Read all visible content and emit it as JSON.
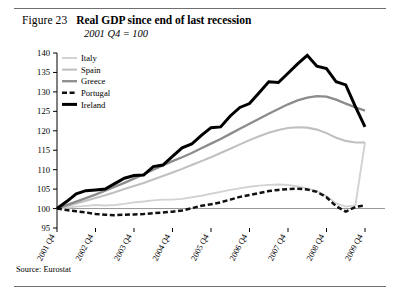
{
  "figure": {
    "number": "Figure 23",
    "title": "Real GDP since end of last recession",
    "subtitle": "2001 Q4 = 100",
    "source": "Source: Eurostat"
  },
  "chart_data": {
    "type": "line",
    "title": "Real GDP since end of last recession",
    "subtitle": "2001 Q4 = 100",
    "xlabel": "",
    "ylabel": "",
    "ylim": [
      95,
      140
    ],
    "yticks": [
      95,
      100,
      105,
      110,
      115,
      120,
      125,
      130,
      135,
      140
    ],
    "grid": false,
    "baseline": 100,
    "legend_position": "top-left",
    "xtick_labels": [
      "2001 Q4",
      "2002 Q4",
      "2003 Q4",
      "2004 Q4",
      "2005 Q4",
      "2006 Q4",
      "2007 Q4",
      "2008 Q4",
      "2009 Q4"
    ],
    "x": [
      "2001 Q4",
      "2002 Q1",
      "2002 Q2",
      "2002 Q3",
      "2002 Q4",
      "2003 Q1",
      "2003 Q2",
      "2003 Q3",
      "2003 Q4",
      "2004 Q1",
      "2004 Q2",
      "2004 Q3",
      "2004 Q4",
      "2005 Q1",
      "2005 Q2",
      "2005 Q3",
      "2005 Q4",
      "2006 Q1",
      "2006 Q2",
      "2006 Q3",
      "2006 Q4",
      "2007 Q1",
      "2007 Q2",
      "2007 Q3",
      "2007 Q4",
      "2008 Q1",
      "2008 Q2",
      "2008 Q3",
      "2008 Q4",
      "2009 Q1",
      "2009 Q2",
      "2009 Q3",
      "2009 Q4"
    ],
    "series": [
      {
        "name": "Italy",
        "color": "#d2d2d2",
        "width": 1.9,
        "dash": "none",
        "values": [
          100.0,
          100.2,
          100.5,
          100.7,
          100.9,
          100.8,
          100.9,
          101.2,
          101.6,
          101.8,
          102.1,
          102.3,
          102.3,
          102.5,
          102.9,
          103.3,
          103.8,
          104.3,
          104.8,
          105.2,
          105.6,
          105.9,
          106.1,
          106.2,
          106.1,
          105.7,
          105.2,
          104.5,
          103.2,
          101.3,
          100.5,
          100.8,
          117.0
        ]
      },
      {
        "name": "Spain",
        "color": "#c0c0c0",
        "width": 2.1,
        "dash": "none",
        "values": [
          100.0,
          100.6,
          101.3,
          102.0,
          102.7,
          103.4,
          104.2,
          105.0,
          105.8,
          106.6,
          107.5,
          108.4,
          109.3,
          110.2,
          111.2,
          112.2,
          113.2,
          114.3,
          115.4,
          116.5,
          117.6,
          118.6,
          119.5,
          120.2,
          120.7,
          120.9,
          120.8,
          120.3,
          119.4,
          118.2,
          117.4,
          117.0,
          117.0
        ]
      },
      {
        "name": "Greece",
        "color": "#8c8c8c",
        "width": 2.3,
        "dash": "none",
        "values": [
          100.0,
          100.9,
          101.8,
          102.7,
          103.6,
          104.6,
          105.6,
          106.6,
          107.7,
          108.8,
          110.0,
          111.1,
          112.2,
          113.2,
          114.3,
          115.5,
          116.7,
          117.9,
          119.2,
          120.5,
          121.8,
          123.1,
          124.4,
          125.6,
          126.8,
          127.8,
          128.5,
          128.9,
          128.8,
          128.0,
          127.0,
          126.0,
          125.2
        ]
      },
      {
        "name": "Portugal",
        "color": "#111111",
        "width": 2.5,
        "dash": "5,2.6",
        "values": [
          100.0,
          99.6,
          99.3,
          99.0,
          98.6,
          98.4,
          98.3,
          98.4,
          98.5,
          98.6,
          98.8,
          99.0,
          99.2,
          99.5,
          100.1,
          100.7,
          101.1,
          101.6,
          102.3,
          103.0,
          103.5,
          104.0,
          104.5,
          104.8,
          105.0,
          105.1,
          104.9,
          104.3,
          102.9,
          100.6,
          99.2,
          100.4,
          100.8
        ]
      },
      {
        "name": "Ireland",
        "color": "#000000",
        "width": 3.0,
        "dash": "none",
        "values": [
          100.0,
          101.8,
          103.8,
          104.6,
          104.8,
          105.0,
          106.4,
          107.8,
          108.5,
          108.6,
          110.8,
          111.2,
          113.4,
          115.6,
          116.6,
          118.8,
          120.8,
          121.0,
          123.8,
          126.0,
          127.0,
          129.8,
          132.6,
          132.4,
          134.8,
          137.2,
          139.4,
          136.6,
          136.0,
          132.6,
          131.8,
          126.2,
          121.0
        ]
      }
    ]
  }
}
